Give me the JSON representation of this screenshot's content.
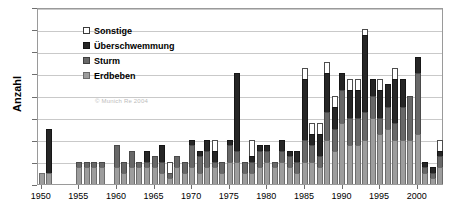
{
  "chart_data": {
    "type": "bar",
    "stacked": true,
    "title": "",
    "xlabel": "",
    "ylabel": "Anzahl",
    "ylim": [
      0,
      16
    ],
    "ytick_step": 2,
    "yticks": [
      0,
      2,
      4,
      6,
      8,
      10,
      12,
      14,
      16
    ],
    "grid": true,
    "legend_position": "top-left",
    "watermark": "© Munich Re 2004",
    "xticks": [
      "1950",
      "1955",
      "1960",
      "1965",
      "1970",
      "1975",
      "1980",
      "1985",
      "1990",
      "1995",
      "2000"
    ],
    "categories": [
      "1950",
      "1951",
      "1952",
      "1953",
      "1954",
      "1955",
      "1956",
      "1957",
      "1958",
      "1959",
      "1960",
      "1961",
      "1962",
      "1963",
      "1964",
      "1965",
      "1966",
      "1967",
      "1968",
      "1969",
      "1970",
      "1971",
      "1972",
      "1973",
      "1974",
      "1975",
      "1976",
      "1977",
      "1978",
      "1979",
      "1980",
      "1981",
      "1982",
      "1983",
      "1984",
      "1985",
      "1986",
      "1987",
      "1988",
      "1989",
      "1990",
      "1991",
      "1992",
      "1993",
      "1994",
      "1995",
      "1996",
      "1997",
      "1998",
      "1999",
      "2000",
      "2001",
      "2002",
      "2003"
    ],
    "series": [
      {
        "name": "Erdbeben",
        "color": "#9d9d9d",
        "values": [
          1,
          1,
          0,
          0,
          0,
          1.5,
          1.5,
          1.5,
          1.5,
          0,
          1.5,
          1,
          1.5,
          1.5,
          1.5,
          1.5,
          1,
          0.5,
          1.5,
          1,
          1.5,
          1,
          1.5,
          1.5,
          1,
          2,
          2,
          1,
          1,
          1.5,
          2,
          1.5,
          2,
          1.5,
          1,
          2,
          2,
          1.5,
          4,
          3,
          5.5,
          3.5,
          3.5,
          4,
          6,
          4.5,
          5,
          4,
          4,
          4,
          4.5,
          1,
          0.5,
          1.5
        ]
      },
      {
        "name": "Sturm",
        "color": "#686868",
        "values": [
          0,
          0,
          0,
          0,
          0,
          0.5,
          0.5,
          0.5,
          0.5,
          0,
          2,
          1,
          1.5,
          0.5,
          0.5,
          1,
          1,
          0.5,
          1,
          1,
          2,
          1.5,
          1.5,
          0.5,
          1,
          1.5,
          1,
          1,
          1,
          1.5,
          1,
          0.5,
          1,
          1,
          1,
          2,
          1.5,
          1,
          2.5,
          2,
          3,
          2.5,
          2.5,
          2.5,
          2,
          1.5,
          2,
          1.5,
          3,
          4,
          5.5,
          0.5,
          0.5,
          1
        ]
      },
      {
        "name": "Überschwemmung",
        "color": "#262626",
        "values": [
          0,
          4,
          0,
          0,
          0,
          0,
          0,
          0,
          0,
          0,
          0,
          0,
          0,
          0,
          1,
          0,
          1.5,
          0,
          0,
          0,
          0.5,
          0.5,
          1,
          1,
          0,
          0.5,
          7,
          0,
          0.5,
          0.5,
          0.5,
          0,
          1,
          0.5,
          1,
          5.5,
          1,
          2,
          3.5,
          2,
          1.5,
          2.5,
          2.5,
          7,
          1.5,
          2.5,
          2,
          4,
          2.5,
          0,
          1.5,
          0.5,
          0.5,
          0.5
        ]
      },
      {
        "name": "Sonstige",
        "color": "#ffffff",
        "values": [
          0,
          0,
          0,
          0,
          0,
          0,
          0,
          0,
          0,
          0,
          0,
          0,
          0,
          0,
          0,
          0,
          0,
          1,
          0,
          0,
          0,
          0,
          0,
          1,
          0,
          0,
          0,
          0,
          1.5,
          0,
          0,
          0,
          0,
          0,
          0,
          1,
          1,
          1,
          1,
          1,
          0,
          1,
          1,
          0.5,
          0,
          1,
          0,
          1,
          0,
          0,
          0,
          0,
          0,
          1
        ]
      }
    ],
    "totals": [
      1,
      5,
      0,
      0,
      0,
      2,
      2,
      2,
      2,
      0,
      3.5,
      2,
      3,
      2.5,
      3,
      2.5,
      3.5,
      2,
      2.5,
      2,
      4,
      3,
      4,
      4,
      2,
      4,
      10,
      2,
      4,
      3.5,
      3.5,
      2,
      4,
      3,
      3,
      10.5,
      5.5,
      5.5,
      11,
      8,
      10,
      9.5,
      9.5,
      14,
      9.5,
      9.5,
      9,
      10.5,
      9.5,
      8,
      11.5,
      2,
      1.5,
      4
    ]
  },
  "legend": {
    "items": [
      {
        "label": "Sonstige",
        "swatch": "sonstige"
      },
      {
        "label": "Überschwemmung",
        "swatch": "ueber"
      },
      {
        "label": "Sturm",
        "swatch": "sturm"
      },
      {
        "label": "Erdbeben",
        "swatch": "erdbeben"
      }
    ]
  }
}
